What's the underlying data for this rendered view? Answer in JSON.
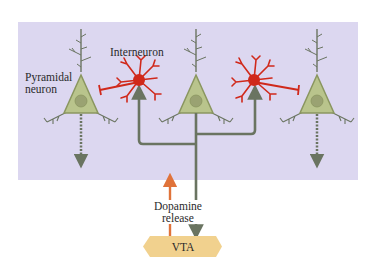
{
  "labels": {
    "pyramidal_line1": "Pyramidal",
    "pyramidal_line2": "neuron",
    "interneuron": "Interneuron",
    "dopamine_line1": "Dopamine",
    "dopamine_line2": "release",
    "vta": "VTA"
  },
  "colors": {
    "panel_background": "#dcd7f0",
    "pyramidal_fill": "#b9c48c",
    "pyramidal_outline": "#8a9660",
    "nucleus": "#9aa272",
    "interneuron_red": "#d0291b",
    "axon_gray": "#6a7461",
    "dopamine_arrow": "#e0733a",
    "vta_fill": "#f1d18e"
  },
  "elements": {
    "pyramidal_neurons": 3,
    "interneurons": 2
  }
}
